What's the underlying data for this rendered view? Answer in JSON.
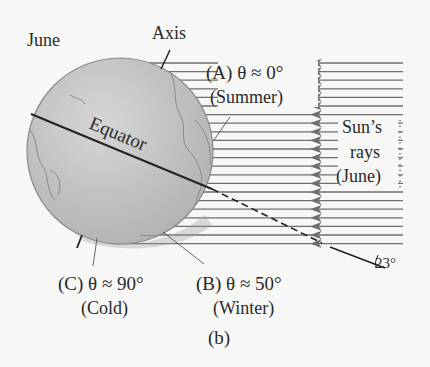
{
  "labels": {
    "june": "June",
    "axis": "Axis",
    "equator": "Equator",
    "a_line1": "(A) θ ≈ 0°",
    "a_line2": "(Summer)",
    "b_line1": "(B) θ ≈ 50°",
    "b_line2": "(Winter)",
    "c_line1": "(C) θ ≈ 90°",
    "c_line2": "(Cold)",
    "sun1": "Sun’s",
    "sun2": "rays",
    "sun3": "(June)",
    "angle": "23°",
    "caption": "(b)"
  },
  "colors": {
    "globe_fill": "#c4c4c4",
    "globe_edge": "#8a8a8a",
    "ray": "#6e6e6e",
    "line": "#222222",
    "background": "#f7f7f5"
  },
  "rays": {
    "count": 22,
    "y_start": 63,
    "spacing": 8.6,
    "x_right": 403,
    "arrow_x": 318
  }
}
